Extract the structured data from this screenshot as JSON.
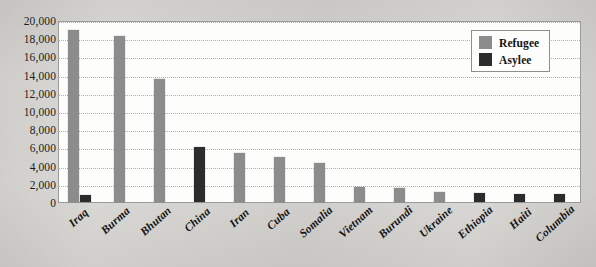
{
  "chart_data": {
    "type": "bar",
    "title": "",
    "xlabel": "",
    "ylabel": "",
    "ylim": [
      0,
      20000
    ],
    "ytick_step": 2000,
    "grid": true,
    "legend_position": "top-right",
    "categories": [
      "Iraq",
      "Burma",
      "Bhutan",
      "China",
      "Iran",
      "Cuba",
      "Somalia",
      "Vietnam",
      "Burundi",
      "Ukraine",
      "Ethiopia",
      "Haiti",
      "Columbia"
    ],
    "ytick_labels": [
      "20,000",
      "18,000",
      "16,000",
      "14,000",
      "12,000",
      "10,000",
      "8,000",
      "6,000",
      "4,000",
      "2,000",
      "0"
    ],
    "ytick_values": [
      20000,
      18000,
      16000,
      14000,
      12000,
      10000,
      8000,
      6000,
      4000,
      2000,
      0
    ],
    "series": [
      {
        "name": "Refugee",
        "color": "#8c8c8c",
        "values": [
          18900,
          18200,
          13500,
          0,
          5400,
          4900,
          4300,
          1600,
          1500,
          1100,
          0,
          0,
          0
        ]
      },
      {
        "name": "Asylee",
        "color": "#2c2c2c",
        "values": [
          800,
          0,
          0,
          6100,
          0,
          0,
          0,
          0,
          0,
          0,
          950,
          900,
          900
        ]
      }
    ],
    "legend": [
      {
        "label": "Refugee",
        "color": "#8c8c8c",
        "swatch": "refugee-swatch"
      },
      {
        "label": "Asylee",
        "color": "#2c2c2c",
        "swatch": "asylee-swatch"
      }
    ]
  },
  "colors": {
    "page_background": "#d9d7d3",
    "plot_background": "#fdfdfc",
    "plot_border": "#9b9b99",
    "gridline": "#9aa6b4",
    "refugee": "#8c8c8c",
    "asylee": "#2c2c2c",
    "text": "#141414"
  }
}
